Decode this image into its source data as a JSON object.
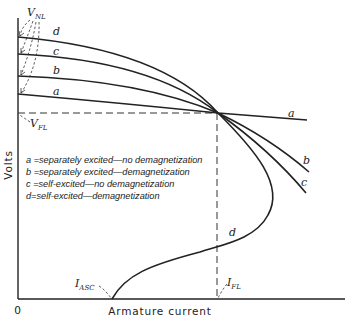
{
  "diagram": {
    "type": "generator-voltage-characteristics",
    "axes": {
      "x_label": "Armature current",
      "y_label": "Volts",
      "origin_label": "0"
    },
    "annotations": {
      "v_nl": "V",
      "v_nl_sub": "NL",
      "v_fl": "V",
      "v_fl_sub": "FL",
      "i_asc": "I",
      "i_asc_sub": "ASC",
      "i_fl": "I",
      "i_fl_sub": "FL"
    },
    "curves": [
      {
        "id": "a",
        "label": "a",
        "description": "separately excited—no demagnetization"
      },
      {
        "id": "b",
        "label": "b",
        "description": "separately excited—demagnetization"
      },
      {
        "id": "c",
        "label": "c",
        "description": "self-excited—no demagnetization"
      },
      {
        "id": "d",
        "label": "d",
        "description": "self-excited—demagnetization"
      }
    ],
    "legend": [
      {
        "key": "a",
        "text": "a =separately excited—no demagnetization"
      },
      {
        "key": "b",
        "text": "b =separately excited—demagnetization"
      },
      {
        "key": "c",
        "text": "c =self-excited—no demagnetization"
      },
      {
        "key": "d",
        "text": "d=self-excited—demagnetization"
      }
    ]
  }
}
